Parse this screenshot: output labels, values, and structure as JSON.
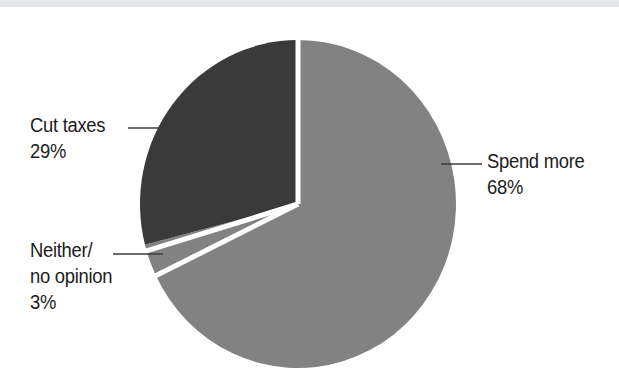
{
  "canvas": {
    "width": 619,
    "height": 391,
    "background": "#ffffff",
    "top_band_color": "#e6e7e8"
  },
  "chart_data": {
    "type": "pie",
    "title": "",
    "subtitle": "",
    "xlabel": "",
    "ylabel": "",
    "legend_position": "none",
    "grid": false,
    "labels_inline": true,
    "categories": [
      "Spend more",
      "Cut taxes",
      "Neither/no opinion"
    ],
    "values": [
      68,
      29,
      3
    ],
    "unit": "%",
    "total": 100,
    "slices": [
      {
        "name": "Spend more",
        "label_line1": "Spend more",
        "label_line2": "68%",
        "value": 68,
        "percent_text": "68%",
        "color": "#828282",
        "start_angle_deg": 0,
        "end_angle_deg": 244.8,
        "label_side": "right"
      },
      {
        "name": "Neither/no opinion",
        "label_line1": "Neither/",
        "label_line2": "no opinion",
        "label_line3": "3%",
        "value": 3,
        "percent_text": "3%",
        "color": "#828282",
        "start_angle_deg": 244.8,
        "end_angle_deg": 255.6,
        "label_side": "left"
      },
      {
        "name": "Cut taxes",
        "label_line1": "Cut taxes",
        "label_line2": "29%",
        "value": 29,
        "percent_text": "29%",
        "color": "#3a3a3a",
        "start_angle_deg": 255.6,
        "end_angle_deg": 360,
        "label_side": "left"
      }
    ],
    "separator_color": "#ffffff",
    "leader_line_color": "#3c3c3c"
  },
  "geometry": {
    "center_x": 298,
    "center_y": 204,
    "radius_x": 158,
    "radius_y": 164
  },
  "leaders": {
    "cut_taxes": {
      "x1": 128,
      "y1": 128,
      "x2": 180,
      "y2": 128
    },
    "neither": {
      "x1": 113,
      "y1": 254,
      "x2": 163,
      "y2": 254
    },
    "spend_more": {
      "x1": 441,
      "y1": 164,
      "x2": 482,
      "y2": 164
    }
  }
}
